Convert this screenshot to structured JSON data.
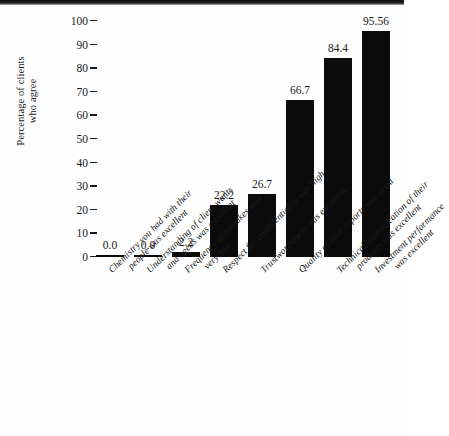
{
  "chart_data": {
    "type": "bar",
    "title": "",
    "subtitle": "",
    "xlabel": "",
    "ylabel": "Percentage of clients who agree",
    "ylabel_lines": [
      "Percentage of clients",
      "who agree"
    ],
    "ylim": [
      0,
      100
    ],
    "yticks": [
      0,
      10,
      20,
      30,
      40,
      50,
      60,
      70,
      80,
      90,
      100
    ],
    "ytick_labels": [
      "0",
      "10",
      "20",
      "30",
      "40",
      "50",
      "60",
      "70",
      "80",
      "90",
      "100"
    ],
    "grid": false,
    "legend": null,
    "bar_color": "#0b0b0b",
    "background_color": "#fefefe",
    "categories": [
      "Chemistry you had with their people was excellent",
      "Understanding of client wants and needs was excellent",
      "Frequency of mistakes was very low",
      "Respect for confidentiality was high",
      "Trustworthiness was excellent",
      "Quality of their reports was good",
      "Technical sophistication of their products was excellent",
      "Investment performance was excellent"
    ],
    "category_lines": [
      [
        "Chemistry you had with their",
        "people was excellent"
      ],
      [
        "Understanding of client wants",
        "and needs was excellent"
      ],
      [
        "Frequency of mistakes was",
        "very low"
      ],
      [
        "Respect for confidentiality was high",
        ""
      ],
      [
        "Trustworthiness was excellent",
        ""
      ],
      [
        "Quality of their reports was good",
        ""
      ],
      [
        "Technical sophistication of their",
        "products was excellent"
      ],
      [
        "Investment performance",
        "was excellent"
      ]
    ],
    "values": [
      0.0,
      0.0,
      2.2,
      22.2,
      26.7,
      66.7,
      84.4,
      95.56
    ],
    "value_labels": [
      "0.0",
      "0.0",
      "2.2",
      "22.2",
      "26.7",
      "66.7",
      "84.4",
      "95.56"
    ]
  }
}
